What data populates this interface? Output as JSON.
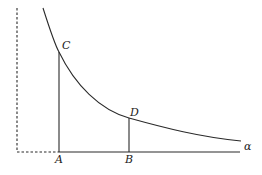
{
  "diagram": {
    "type": "geometry-curve",
    "colors": {
      "stroke": "#2a2a2a",
      "background": "#ffffff"
    },
    "labels": {
      "C": "C",
      "D": "D",
      "A": "A",
      "B": "B",
      "alpha": "α"
    }
  }
}
